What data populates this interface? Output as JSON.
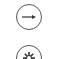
{
  "buttons": [
    {
      "name": "next-button",
      "icon": "arrow-right-icon"
    },
    {
      "name": "settings-button",
      "icon": "gear-icon"
    }
  ],
  "colors": {
    "stroke": "#555555",
    "background": "#ffffff"
  }
}
